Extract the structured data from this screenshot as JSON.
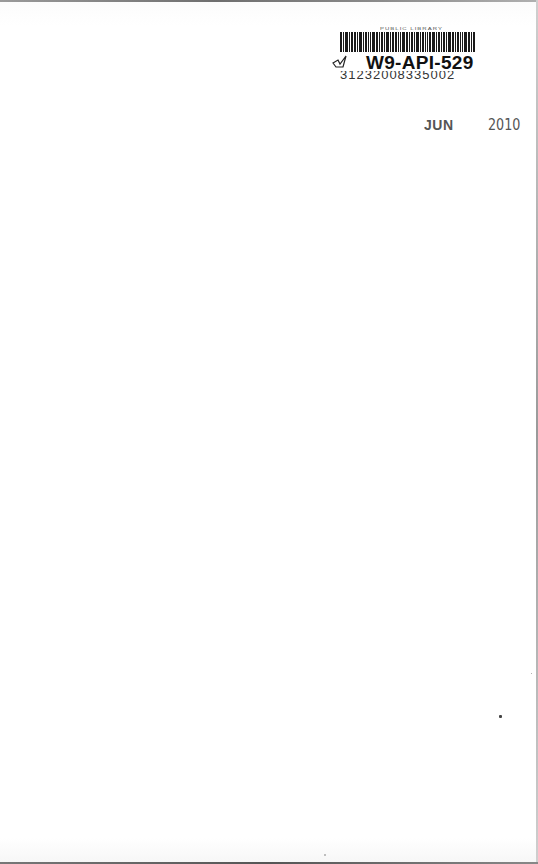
{
  "page": {
    "type": "scanned-book-endpaper",
    "background": "#ffffff"
  },
  "sticker": {
    "library_name": "PUBLIC LIBRARY",
    "call_id": "W9-API-529",
    "barcode_number": "31232008335002",
    "icon": "check-mark-icon"
  },
  "date_stamp": {
    "month": "JUN",
    "year": "2010",
    "color": "#555555"
  }
}
